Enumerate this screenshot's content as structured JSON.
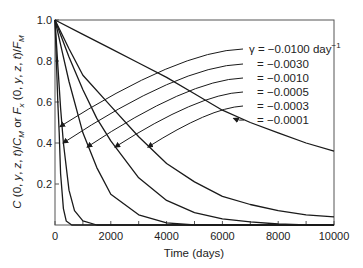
{
  "chart_data": {
    "type": "line",
    "title": "",
    "xlabel": "Time (days)",
    "ylabel": "C(0, y, z, t)/C_M or F_x(0, y, z, t)/F_M",
    "xlim": [
      0,
      10000
    ],
    "ylim": [
      0,
      1.0
    ],
    "xticks": [
      0,
      2000,
      4000,
      6000,
      8000,
      10000
    ],
    "xtick_labels": [
      "0",
      "2000",
      "4000",
      "6000",
      "8000",
      "10000"
    ],
    "x_minor_ticks": [
      1000,
      3000,
      5000,
      7000,
      9000
    ],
    "yticks": [
      0.2,
      0.4,
      0.6,
      0.8,
      1.0
    ],
    "ytick_labels": [
      "0.2",
      "0.4",
      "0.6",
      "0.8",
      "1.0"
    ],
    "grid": false,
    "legend_position": "upper right (annotated with arrows)",
    "series": [
      {
        "name": "γ = −0.0100 day⁻¹",
        "label_prefix": "γ = ",
        "label_value": "−0.0100 day",
        "label_sup": "−1",
        "x": [
          0,
          50,
          100,
          150,
          200,
          300,
          400,
          600,
          10000
        ],
        "values": [
          1.0,
          0.8,
          0.6,
          0.45,
          0.25,
          0.08,
          0.02,
          0.0,
          0.0
        ],
        "arrow_to": [
          180,
          0.48
        ]
      },
      {
        "name": "= −0.0030",
        "label_prefix": "= ",
        "label_value": "−0.0030",
        "label_sup": "",
        "x": [
          0,
          100,
          200,
          300,
          500,
          700,
          1000,
          1500,
          10000
        ],
        "values": [
          1.0,
          0.78,
          0.57,
          0.4,
          0.17,
          0.07,
          0.02,
          0.0,
          0.0
        ],
        "arrow_to": [
          290,
          0.4
        ]
      },
      {
        "name": "= −0.0010",
        "label_prefix": "= ",
        "label_value": "−0.0010",
        "label_sup": "",
        "x": [
          0,
          250,
          500,
          1000,
          1500,
          2000,
          3000,
          4000,
          5000,
          10000
        ],
        "values": [
          1.0,
          0.85,
          0.7,
          0.45,
          0.28,
          0.15,
          0.05,
          0.01,
          0.0,
          0.0
        ],
        "arrow_to": [
          1150,
          0.38
        ]
      },
      {
        "name": "= −0.0005",
        "label_prefix": "= ",
        "label_value": "−0.0005",
        "label_sup": "",
        "x": [
          0,
          500,
          1000,
          1500,
          2000,
          3000,
          4000,
          5000,
          6000,
          7000,
          8000,
          9000,
          10000
        ],
        "values": [
          1.0,
          0.82,
          0.66,
          0.52,
          0.41,
          0.23,
          0.12,
          0.06,
          0.03,
          0.015,
          0.005,
          0.0,
          0.0
        ],
        "arrow_to": [
          2150,
          0.38
        ]
      },
      {
        "name": "= −0.0003",
        "label_prefix": "= ",
        "label_value": "−0.0003",
        "label_sup": "",
        "x": [
          0,
          500,
          1000,
          2000,
          3000,
          4000,
          5000,
          6000,
          7000,
          8000,
          9000,
          10000
        ],
        "values": [
          1.0,
          0.86,
          0.73,
          0.58,
          0.43,
          0.3,
          0.21,
          0.14,
          0.1,
          0.07,
          0.05,
          0.04
        ],
        "arrow_to": [
          3330,
          0.38
        ]
      },
      {
        "name": "= −0.0001",
        "label_prefix": "= ",
        "label_value": "−0.0001",
        "label_sup": "",
        "x": [
          0,
          1000,
          2000,
          3000,
          4000,
          5000,
          6000,
          7000,
          8000,
          9000,
          10000
        ],
        "values": [
          1.0,
          0.93,
          0.86,
          0.79,
          0.72,
          0.64,
          0.56,
          0.5,
          0.45,
          0.4,
          0.36
        ],
        "arrow_to": [
          6400,
          0.52
        ]
      }
    ]
  },
  "axes": {
    "xlabel": "Time (days)",
    "ylabel_parts": [
      "C",
      " (0, ",
      "y",
      ", ",
      "z",
      ", ",
      "t",
      ")/",
      "C",
      "M",
      " or ",
      "F",
      "x",
      " (0, ",
      "y",
      ", ",
      "z",
      ", ",
      "t",
      ")/",
      "F",
      "M"
    ]
  },
  "colors": {
    "line": "#1a1a1a",
    "axis": "#444444",
    "text": "#222222"
  }
}
